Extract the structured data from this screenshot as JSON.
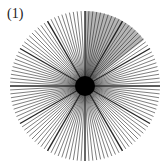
{
  "figure": {
    "label": "(1)",
    "type": "radial-line-star",
    "center": [
      85,
      86
    ],
    "radius": 75,
    "line_count": 120,
    "major_every": 10,
    "shaded_sector": {
      "start_deg": 0,
      "end_deg": 52,
      "color": "#7a7a7a"
    },
    "line_color": "#1a1a1a",
    "center_disk_radius": 10
  }
}
